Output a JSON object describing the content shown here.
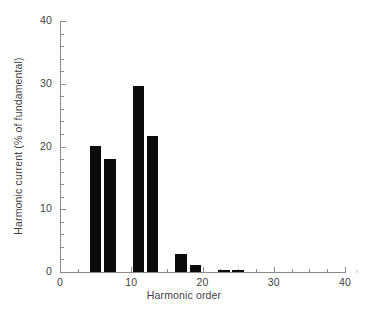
{
  "chart_data": {
    "type": "bar",
    "title": "",
    "xlabel": "Harmonic order",
    "ylabel": "Harmonic current (% of fundamental)",
    "xlim": [
      0,
      40
    ],
    "ylim": [
      0,
      40
    ],
    "grid": false,
    "legend": null,
    "bar_color": "#0b0b0b",
    "axis_color": "#8a8a8a",
    "x_ticks": [
      0,
      10,
      20,
      30,
      40
    ],
    "x_tick_labels": [
      "0",
      "10",
      "20",
      "30",
      "40"
    ],
    "x_minor_tick_step": 2.5,
    "y_ticks": [
      0,
      10,
      20,
      30,
      40
    ],
    "y_tick_labels": [
      "0",
      "10",
      "20",
      "30",
      "40"
    ],
    "y_minor_tick_step": 2,
    "bar_width": 1.6,
    "categories": [
      5,
      7,
      11,
      13,
      17,
      19,
      23,
      25
    ],
    "values": [
      20.1,
      18.0,
      29.6,
      21.7,
      2.8,
      1.1,
      0.4,
      0.25
    ],
    "annotations": [
      "«"
    ]
  }
}
